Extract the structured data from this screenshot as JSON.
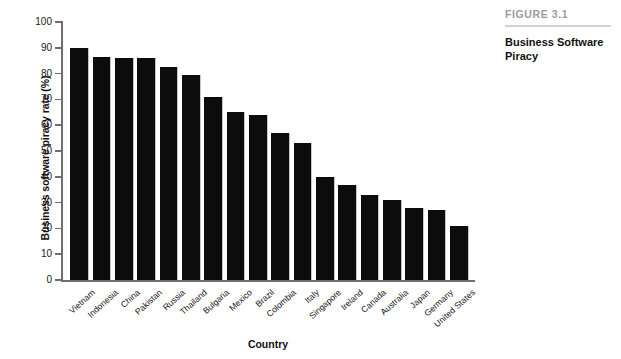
{
  "caption": {
    "figure_number": "FIGURE 3.1",
    "title": "Business Software Piracy"
  },
  "chart_data": {
    "type": "bar",
    "title": "Business Software Piracy",
    "xlabel": "Country",
    "ylabel": "Business software piracy rate (%)",
    "ylim": [
      0,
      100
    ],
    "ytick_step": 10,
    "yticks": [
      0,
      10,
      20,
      30,
      40,
      50,
      60,
      70,
      80,
      90,
      100
    ],
    "ytick_labels": [
      "0",
      "10",
      "20",
      "30",
      "40",
      "50",
      "60",
      "70",
      "80",
      "90",
      "100"
    ],
    "grid": false,
    "legend": "none",
    "bar_color": "#0c0c0c",
    "categories": [
      "Vietnam",
      "Indonesia",
      "China",
      "Pakistan",
      "Russia",
      "Thailand",
      "Bulgaria",
      "Mexico",
      "Brazil",
      "Colombia",
      "Italy",
      "Singapore",
      "Ireland",
      "Canada",
      "Australia",
      "Japan",
      "Germany",
      "United States"
    ],
    "values": [
      90,
      86.5,
      86,
      86,
      82.5,
      79.5,
      71,
      65,
      64,
      57,
      53,
      40,
      37,
      33,
      31,
      28,
      27,
      21
    ]
  }
}
